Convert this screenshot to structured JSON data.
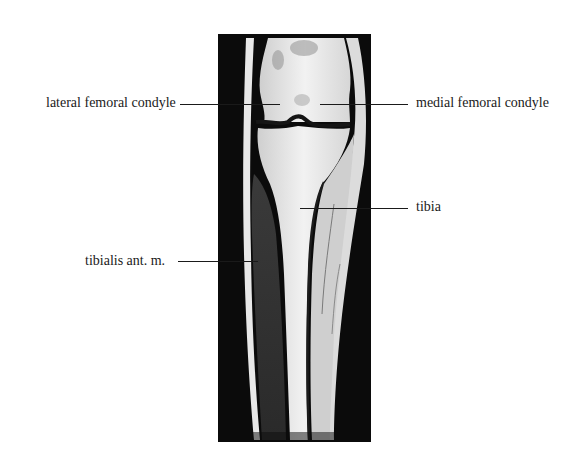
{
  "figure": {
    "type": "MRI coronal section of knee and lower leg",
    "labels": [
      {
        "id": "lateral-femoral-condyle",
        "text": "lateral femoral condyle",
        "side": "left"
      },
      {
        "id": "medial-femoral-condyle",
        "text": "medial femoral condyle",
        "side": "right"
      },
      {
        "id": "tibia",
        "text": "tibia",
        "side": "right"
      },
      {
        "id": "tibialis-anterior",
        "text": "tibialis ant. m.",
        "side": "left"
      }
    ]
  },
  "colors": {
    "background": "#ffffff",
    "frame": "#0a0a0a",
    "text": "#1a1a1a"
  }
}
